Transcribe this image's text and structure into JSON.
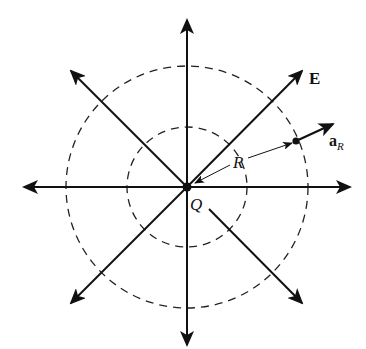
{
  "diagram": {
    "center": {
      "x": 187,
      "y": 187
    },
    "colors": {
      "ink": "#111111",
      "background": "#ffffff"
    },
    "circles": [
      {
        "name": "inner-equipotential",
        "r": 60,
        "style": "dashed"
      },
      {
        "name": "outer-equipotential",
        "r": 121,
        "style": "dashed"
      }
    ],
    "field_lines": [
      {
        "name": "up",
        "x1": 187,
        "y1": 187,
        "x2": 187,
        "y2": 20,
        "from_center": true
      },
      {
        "name": "down",
        "x1": 187,
        "y1": 187,
        "x2": 187,
        "y2": 345,
        "from_center": true
      },
      {
        "name": "left",
        "x1": 187,
        "y1": 187,
        "x2": 24,
        "y2": 187,
        "from_center": true
      },
      {
        "name": "right",
        "x1": 187,
        "y1": 187,
        "x2": 350,
        "y2": 187,
        "from_center": true
      },
      {
        "name": "up-left",
        "x1": 187,
        "y1": 187,
        "x2": 71,
        "y2": 71,
        "from_center": true
      },
      {
        "name": "up-right",
        "x1": 187,
        "y1": 187,
        "x2": 302,
        "y2": 71,
        "from_center": true
      },
      {
        "name": "down-left",
        "x1": 187,
        "y1": 187,
        "x2": 71,
        "y2": 303,
        "from_center": true
      },
      {
        "name": "down-right",
        "x1": 209,
        "y1": 209,
        "x2": 302,
        "y2": 303,
        "from_center": false
      }
    ],
    "point": {
      "x": 296,
      "y": 141
    },
    "labels": {
      "field": "E",
      "unit_vector_main": "a",
      "unit_vector_sub": "R",
      "distance": "R",
      "charge": "Q"
    }
  }
}
